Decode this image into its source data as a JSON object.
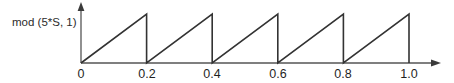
{
  "figure": {
    "name": "sawtooth-waveform-plot",
    "background_color": "#ffffff",
    "line_color": "#333333",
    "axis_color": "#555555",
    "text_color": "#1f1f1f"
  },
  "ylabel_text": "mod (5*S, 1)",
  "ticks": {
    "x": [
      "0",
      "0.2",
      "0.4",
      "0.6",
      "0.8",
      "1.0"
    ]
  },
  "chart_data": {
    "type": "line",
    "title": "",
    "subtitle": "",
    "xlabel": "",
    "ylabel": "mod (5*S, 1)",
    "xlim": [
      0,
      1.09
    ],
    "ylim": [
      0,
      1.0
    ],
    "grid": false,
    "legend": null,
    "xticks": [
      0,
      0.2,
      0.4,
      0.6,
      0.8,
      1.0
    ],
    "xticklabels": [
      "0",
      "0.2",
      "0.4",
      "0.6",
      "0.8",
      "1.0"
    ],
    "yticks": [],
    "yticklabels": [],
    "annotations": [
      "mod (5*S, 1)"
    ],
    "function": "mod(5*S, 1)",
    "period": 0.2,
    "num_periods": 5,
    "amplitude": 1,
    "series": [
      {
        "name": "mod (5*S, 1)",
        "color": "#333333",
        "x": [
          0,
          0.2,
          0.2,
          0.4,
          0.4,
          0.6,
          0.6,
          0.8,
          0.8,
          1.0,
          1.0
        ],
        "y": [
          0,
          1,
          0,
          1,
          0,
          1,
          0,
          1,
          0,
          1,
          0
        ]
      }
    ]
  }
}
